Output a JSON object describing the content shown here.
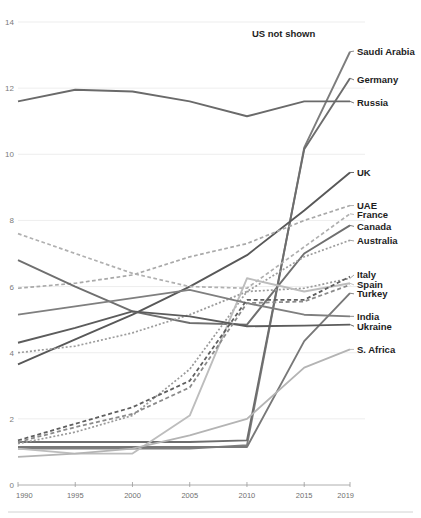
{
  "chart_data": {
    "type": "line",
    "title": "",
    "subtitle": "",
    "xlabel": "",
    "ylabel": "",
    "xlim": [
      1990,
      2019
    ],
    "ylim": [
      0,
      14
    ],
    "yticks": [
      0,
      2,
      4,
      6,
      8,
      10,
      12,
      14
    ],
    "ytick_labels": [
      "0",
      "2",
      "4",
      "6",
      "8",
      "10",
      "12",
      "14"
    ],
    "xticks": [
      1990,
      1995,
      2000,
      2005,
      2010,
      2015,
      2019
    ],
    "xtick_labels": [
      "1990",
      "1995",
      "2000",
      "2005",
      "2010",
      "2015",
      "2019"
    ],
    "grid": true,
    "legend_position": "right-inline-labels",
    "annotations": [
      {
        "text": "US not shown",
        "x": 2013.2,
        "y": 13.55
      }
    ],
    "x": [
      1990,
      1995,
      2000,
      2005,
      2010,
      2015,
      2019
    ],
    "series": [
      {
        "name": "Saudi Arabia",
        "label": "Saudi Arabia",
        "color": "#7d7d7d",
        "style": "solid",
        "width": 1.9,
        "label_y": 13.12,
        "values": [
          1.1,
          1.1,
          1.1,
          1.1,
          1.2,
          10.2,
          13.1
        ]
      },
      {
        "name": "Germany",
        "label": "Germany",
        "color": "#6d6d6d",
        "style": "solid",
        "width": 1.9,
        "label_y": 12.25,
        "values": [
          1.3,
          1.3,
          1.3,
          1.3,
          1.35,
          10.15,
          12.3
        ]
      },
      {
        "name": "Russia",
        "label": "Russia",
        "color": "#6a6a6a",
        "style": "solid",
        "width": 1.9,
        "label_y": 11.55,
        "values": [
          11.6,
          11.95,
          11.9,
          11.6,
          11.15,
          11.6,
          11.6
        ]
      },
      {
        "name": "UK",
        "label": "UK",
        "color": "#585858",
        "style": "solid",
        "width": 1.9,
        "label_y": 9.45,
        "values": [
          3.65,
          4.4,
          5.15,
          6.0,
          6.95,
          8.3,
          9.45
        ]
      },
      {
        "name": "UAE",
        "label": "UAE",
        "color": "#a9a9a9",
        "style": "dashed",
        "width": 1.7,
        "label_y": 8.45,
        "values": [
          5.95,
          6.1,
          6.35,
          6.9,
          7.3,
          8.0,
          8.45
        ]
      },
      {
        "name": "France",
        "label": "France",
        "color": "#b0b0b0",
        "style": "dashed",
        "width": 1.7,
        "label_y": 8.18,
        "values": [
          7.6,
          7.0,
          6.4,
          6.0,
          5.95,
          7.2,
          8.2
        ]
      },
      {
        "name": "Canada",
        "label": "Canada",
        "color": "#6f6f6f",
        "style": "solid",
        "width": 1.9,
        "label_y": 7.82,
        "values": [
          6.8,
          6.0,
          5.25,
          4.9,
          4.85,
          7.0,
          7.85
        ]
      },
      {
        "name": "Australia",
        "label": "Australia",
        "color": "#9c9c9c",
        "style": "dotted",
        "width": 1.7,
        "label_y": 7.38,
        "values": [
          4.0,
          4.2,
          4.6,
          5.15,
          5.85,
          6.9,
          7.4
        ]
      },
      {
        "name": "Italy",
        "label": "Italy",
        "color": "#9a9a9a",
        "style": "dotted",
        "width": 1.7,
        "label_y": 6.35,
        "values": [
          1.25,
          1.6,
          2.1,
          3.5,
          5.85,
          5.95,
          6.25
        ]
      },
      {
        "name": "Spain",
        "label": "Spain",
        "color": "#bdbdbd",
        "style": "solid",
        "width": 1.9,
        "label_y": 6.05,
        "values": [
          1.1,
          0.95,
          0.95,
          2.1,
          6.25,
          5.85,
          6.1
        ]
      },
      {
        "name": "Turkey",
        "label": "Turkey",
        "color": "#787878",
        "style": "solid",
        "width": 1.9,
        "label_y": 5.78,
        "values": [
          1.15,
          1.15,
          1.15,
          1.15,
          1.15,
          4.35,
          5.8
        ]
      },
      {
        "name": "India",
        "label": "India",
        "color": "#7f7f7f",
        "style": "solid",
        "width": 1.9,
        "label_y": 5.1,
        "values": [
          5.15,
          5.4,
          5.65,
          5.9,
          5.5,
          5.15,
          5.1
        ]
      },
      {
        "name": "Ukraine",
        "label": "Ukraine",
        "color": "#5c5c5c",
        "style": "solid",
        "width": 1.9,
        "label_y": 4.8,
        "values": [
          4.3,
          4.75,
          5.25,
          5.1,
          4.8,
          4.82,
          4.85
        ]
      },
      {
        "name": "S. Africa",
        "label": "S. Africa",
        "color": "#b4b4b4",
        "style": "solid",
        "width": 1.9,
        "label_y": 4.1,
        "values": [
          0.85,
          0.95,
          1.1,
          1.5,
          2.0,
          3.55,
          4.1
        ]
      },
      {
        "name": "dashed-low-a",
        "label": "",
        "color": "#5f5f5f",
        "style": "dashed",
        "width": 1.8,
        "label_y": null,
        "values": [
          1.35,
          1.85,
          2.35,
          3.15,
          5.6,
          5.6,
          6.3
        ]
      },
      {
        "name": "dashed-low-b",
        "label": "",
        "color": "#8b8b8b",
        "style": "dashed",
        "width": 1.8,
        "label_y": null,
        "values": [
          1.3,
          1.75,
          2.15,
          2.95,
          5.5,
          5.55,
          6.05
        ]
      }
    ]
  },
  "axis": {
    "y_label_color": "#7b7b7b",
    "x_label_color": "#6f6f6f",
    "grid_color": "#e8e8e8",
    "axis_color": "#9a9a9a"
  }
}
